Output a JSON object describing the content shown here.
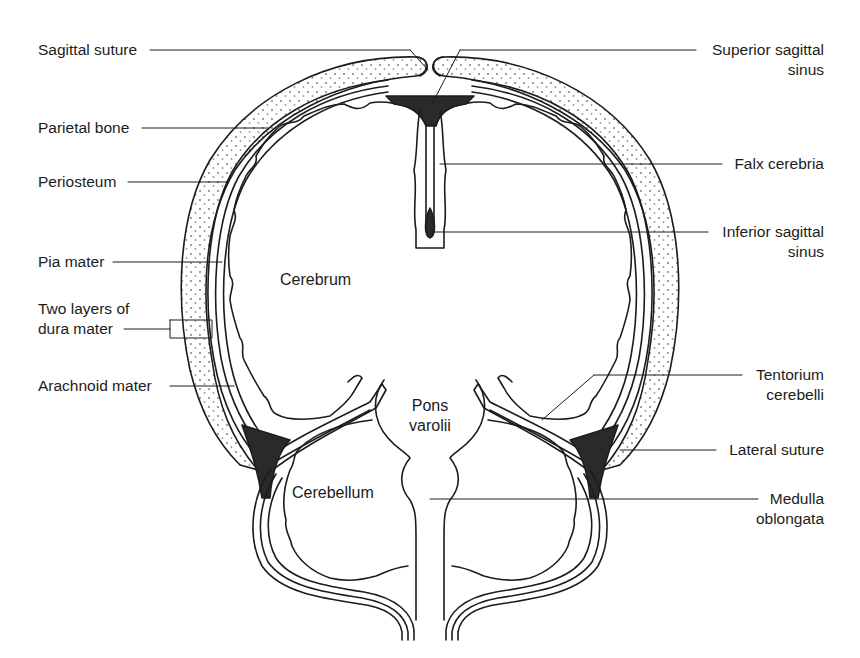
{
  "diagram": {
    "colors": {
      "line": "#1c1c1c",
      "sinus_fill": "#2a2a2a",
      "bone_stipple": "#8a8a8a",
      "background": "#ffffff"
    },
    "labels_left": [
      {
        "id": "sagittal-suture",
        "text": "Sagittal suture"
      },
      {
        "id": "parietal-bone",
        "text": "Parietal bone"
      },
      {
        "id": "periosteum",
        "text": "Periosteum"
      },
      {
        "id": "pia-mater",
        "text": "Pia mater"
      },
      {
        "id": "dura-mater",
        "line1": "Two layers of",
        "line2": "dura mater"
      },
      {
        "id": "arachnoid-mater",
        "text": "Arachnoid mater"
      }
    ],
    "labels_right": [
      {
        "id": "superior-sagittal-sinus",
        "line1": "Superior sagittal",
        "line2": "sinus"
      },
      {
        "id": "falx-cerebria",
        "text": "Falx cerebria"
      },
      {
        "id": "inferior-sagittal-sinus",
        "line1": "Inferior sagittal",
        "line2": "sinus"
      },
      {
        "id": "tentorium-cerebelli",
        "line1": "Tentorium",
        "line2": "cerebelli"
      },
      {
        "id": "lateral-suture",
        "text": "Lateral suture"
      },
      {
        "id": "medulla-oblongata",
        "line1": "Medulla",
        "line2": "oblongata"
      }
    ],
    "labels_inner": {
      "cerebrum": "Cerebrum",
      "pons_line1": "Pons",
      "pons_line2": "varolii",
      "cerebellum": "Cerebellum"
    }
  }
}
